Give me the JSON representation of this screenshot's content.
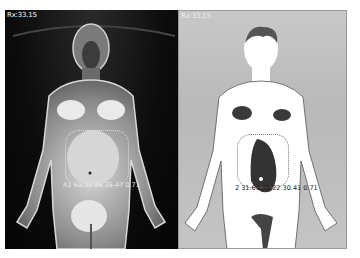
{
  "panels": [
    {
      "id": "thermal-raw",
      "header": "Rx:33.15",
      "roi_label": "A1 63.32 26.35 47 0.71",
      "colors": {
        "background": "#0c0c0c",
        "body": "#9a9a9a",
        "hot": "#f2f2f2"
      }
    },
    {
      "id": "thermal-threshold",
      "header": "Rx:33.15",
      "roi_label": "2 31.69 29.22 30.41 0.71",
      "colors": {
        "background": "#c0c0c0",
        "body": "#ffffff",
        "region": "#3a3a3a"
      }
    }
  ]
}
